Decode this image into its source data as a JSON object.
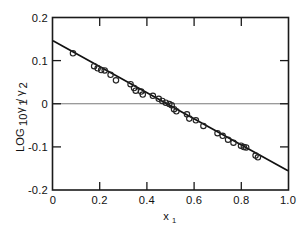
{
  "figure": {
    "background_color": "#ffffff",
    "line_color": "#111111",
    "marker_color": "#232323",
    "axis_color": "#1a1a1a",
    "zeroline_color": "#7a7a7a"
  },
  "axes": {
    "x": {
      "label_main": "x",
      "label_sub": "1",
      "min": 0,
      "max": 1.0,
      "ticks": [
        0,
        0.2,
        0.4,
        0.6,
        0.8,
        1.0
      ],
      "tick_labels": [
        "0",
        "0.2",
        "0.4",
        "0.6",
        "0.8",
        "1.0"
      ]
    },
    "y": {
      "label_prefix": "LOG",
      "label_prefix_sub": "10",
      "label_numer": "γ",
      "label_numer_sub": "1",
      "label_slash": "/",
      "label_denom": "γ",
      "label_denom_sub": "2",
      "min": -0.2,
      "max": 0.2,
      "ticks": [
        0.2,
        0.1,
        0,
        -0.1,
        -0.2
      ],
      "tick_labels": [
        "0.2",
        "0.1",
        "0",
        "-0.1",
        "-0.2"
      ]
    }
  },
  "chart_data": {
    "type": "scatter",
    "title": "",
    "xlabel": "x1",
    "ylabel": "LOG10 γ1/γ2",
    "xlim": [
      0,
      1.0
    ],
    "ylim": [
      -0.2,
      0.2
    ],
    "grid": false,
    "legend": null,
    "zero_reference_line": 0,
    "series": [
      {
        "name": "experimental points",
        "marker": "open-circle",
        "points": [
          [
            0.085,
            0.118
          ],
          [
            0.175,
            0.088
          ],
          [
            0.19,
            0.083
          ],
          [
            0.205,
            0.079
          ],
          [
            0.22,
            0.078
          ],
          [
            0.245,
            0.068
          ],
          [
            0.268,
            0.055
          ],
          [
            0.33,
            0.046
          ],
          [
            0.345,
            0.037
          ],
          [
            0.352,
            0.031
          ],
          [
            0.375,
            0.029
          ],
          [
            0.382,
            0.022
          ],
          [
            0.425,
            0.019
          ],
          [
            0.45,
            0.012
          ],
          [
            0.465,
            0.007
          ],
          [
            0.48,
            0.003
          ],
          [
            0.495,
            0.0
          ],
          [
            0.505,
            -0.003
          ],
          [
            0.515,
            -0.012
          ],
          [
            0.525,
            -0.017
          ],
          [
            0.57,
            -0.024
          ],
          [
            0.58,
            -0.034
          ],
          [
            0.608,
            -0.038
          ],
          [
            0.64,
            -0.051
          ],
          [
            0.7,
            -0.068
          ],
          [
            0.722,
            -0.074
          ],
          [
            0.745,
            -0.083
          ],
          [
            0.768,
            -0.09
          ],
          [
            0.8,
            -0.097
          ],
          [
            0.812,
            -0.1
          ],
          [
            0.822,
            -0.101
          ],
          [
            0.862,
            -0.12
          ],
          [
            0.872,
            -0.124
          ]
        ]
      },
      {
        "name": "linear fit",
        "type": "line",
        "endpoints": [
          [
            0.0,
            0.147
          ],
          [
            1.0,
            -0.155
          ]
        ],
        "slope": -0.302,
        "intercept": 0.147
      }
    ]
  }
}
